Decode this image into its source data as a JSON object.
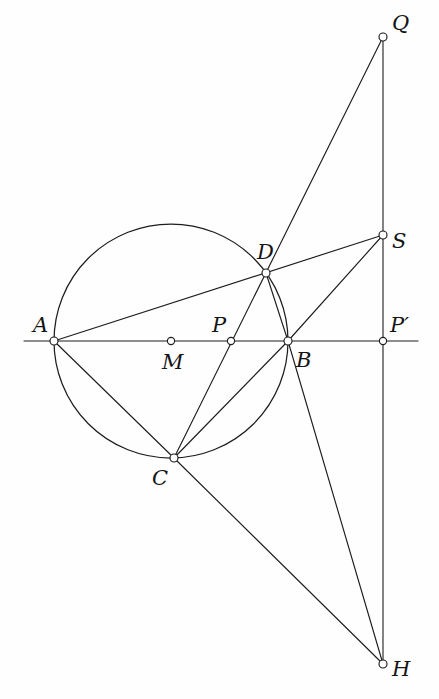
{
  "figure": {
    "canvas": {
      "width": 439,
      "height": 699
    },
    "colors": {
      "background": "#fefefe",
      "stroke": "#1d1d1d",
      "marker_fill": "#ffffff",
      "label": "#141414"
    },
    "circle": {
      "name": "main-circle",
      "center_label": "M",
      "cx": 171,
      "cy": 341,
      "r": 117
    },
    "points": [
      {
        "id": "A",
        "label": "A",
        "x": 54,
        "y": 341,
        "label_x": 33,
        "label_y": 332,
        "marker_r": 4.0
      },
      {
        "id": "M",
        "label": "M",
        "x": 171,
        "y": 341,
        "label_x": 162,
        "label_y": 369,
        "marker_r": 3.6
      },
      {
        "id": "P",
        "label": "P",
        "x": 231,
        "y": 341,
        "label_x": 212,
        "label_y": 332,
        "marker_r": 3.6
      },
      {
        "id": "B",
        "label": "B",
        "x": 288,
        "y": 341,
        "label_x": 296,
        "label_y": 367,
        "marker_r": 4.0
      },
      {
        "id": "Pp",
        "label": "P′",
        "x": 383,
        "y": 341,
        "label_x": 390,
        "label_y": 332,
        "marker_r": 3.6
      },
      {
        "id": "C",
        "label": "C",
        "x": 174,
        "y": 458,
        "label_x": 152,
        "label_y": 485,
        "marker_r": 4.0
      },
      {
        "id": "D",
        "label": "D",
        "x": 266,
        "y": 273,
        "label_x": 257,
        "label_y": 259,
        "marker_r": 4.0
      },
      {
        "id": "Q",
        "label": "Q",
        "x": 383,
        "y": 37,
        "label_x": 392,
        "label_y": 30,
        "marker_r": 4.0
      },
      {
        "id": "S",
        "label": "S",
        "x": 383,
        "y": 235,
        "label_x": 392,
        "label_y": 248,
        "marker_r": 4.0
      },
      {
        "id": "H",
        "label": "H",
        "x": 383,
        "y": 664,
        "label_x": 392,
        "label_y": 676,
        "marker_r": 4.0
      }
    ],
    "segments": [
      {
        "name": "baseline-horizontal",
        "kind": "axis",
        "x1": 24,
        "y1": 341,
        "x2": 418,
        "y2": 341
      },
      {
        "name": "vertical-QH",
        "kind": "axis",
        "x1": 383,
        "y1": 37,
        "x2": 383,
        "y2": 664
      },
      {
        "name": "line-A-to-S",
        "kind": "line",
        "x1": 54,
        "y1": 341,
        "x2": 383,
        "y2": 235
      },
      {
        "name": "line-A-to-C",
        "kind": "line",
        "x1": 54,
        "y1": 341,
        "x2": 174,
        "y2": 458
      },
      {
        "name": "line-C-to-Q",
        "kind": "line",
        "x1": 174,
        "y1": 458,
        "x2": 383,
        "y2": 37
      },
      {
        "name": "line-C-to-B",
        "kind": "line",
        "x1": 174,
        "y1": 458,
        "x2": 288,
        "y2": 341
      },
      {
        "name": "line-C-to-H",
        "kind": "line",
        "x1": 174,
        "y1": 458,
        "x2": 383,
        "y2": 664
      },
      {
        "name": "line-D-to-B",
        "kind": "line",
        "x1": 266,
        "y1": 273,
        "x2": 288,
        "y2": 341
      },
      {
        "name": "line-B-to-S",
        "kind": "line",
        "x1": 288,
        "y1": 341,
        "x2": 383,
        "y2": 235
      },
      {
        "name": "line-B-to-H",
        "kind": "line",
        "x1": 288,
        "y1": 341,
        "x2": 383,
        "y2": 664
      }
    ]
  },
  "chart_data": {
    "type": "scatter",
    "title": "",
    "xlabel": "",
    "ylabel": "",
    "grid": false,
    "legend": "none",
    "points": [
      {
        "label": "A",
        "x": 54,
        "y": 341
      },
      {
        "label": "M",
        "x": 171,
        "y": 341
      },
      {
        "label": "P",
        "x": 231,
        "y": 341
      },
      {
        "label": "B",
        "x": 288,
        "y": 341
      },
      {
        "label": "P′",
        "x": 383,
        "y": 341
      },
      {
        "label": "C",
        "x": 174,
        "y": 458
      },
      {
        "label": "D",
        "x": 266,
        "y": 273
      },
      {
        "label": "Q",
        "x": 383,
        "y": 37
      },
      {
        "label": "S",
        "x": 383,
        "y": 235
      },
      {
        "label": "H",
        "x": 383,
        "y": 664
      }
    ],
    "xlim": [
      0,
      439
    ],
    "ylim": [
      0,
      699
    ]
  }
}
